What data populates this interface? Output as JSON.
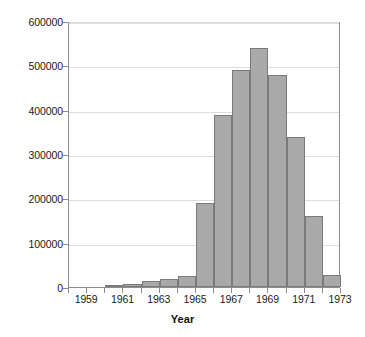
{
  "chart_data": {
    "type": "bar",
    "title": "",
    "subtitle": "",
    "xlabel": "Year",
    "ylabel": "",
    "categories": [
      1958,
      1959,
      1960,
      1961,
      1962,
      1963,
      1964,
      1965,
      1966,
      1967,
      1968,
      1969,
      1970,
      1971,
      1972
    ],
    "values": [
      0,
      0,
      1000,
      7000,
      13000,
      19000,
      25000,
      189000,
      389000,
      489000,
      539000,
      479000,
      338000,
      161000,
      28000
    ],
    "ylim": [
      0,
      600000
    ],
    "xlim": [
      1958,
      1973
    ],
    "ytick_labels": [
      "0",
      "100000",
      "200000",
      "300000",
      "400000",
      "500000",
      "600000"
    ],
    "ytick_values": [
      0,
      100000,
      200000,
      300000,
      400000,
      500000,
      600000
    ],
    "xtick_labels": [
      "1959",
      "1961",
      "1963",
      "1965",
      "1967",
      "1969",
      "1971",
      "1973"
    ],
    "xtick_values": [
      1959,
      1961,
      1963,
      1965,
      1967,
      1969,
      1971,
      1973
    ],
    "grid": true,
    "legend": null,
    "legend_position": "none",
    "bar_color": "#a9a9a9",
    "bar_edge_color": "#7a7a7a",
    "grid_color": "#dddddd",
    "axis_color": "#8d8d8d",
    "text_color": "#1a1a1a",
    "background": "#ffffff"
  }
}
